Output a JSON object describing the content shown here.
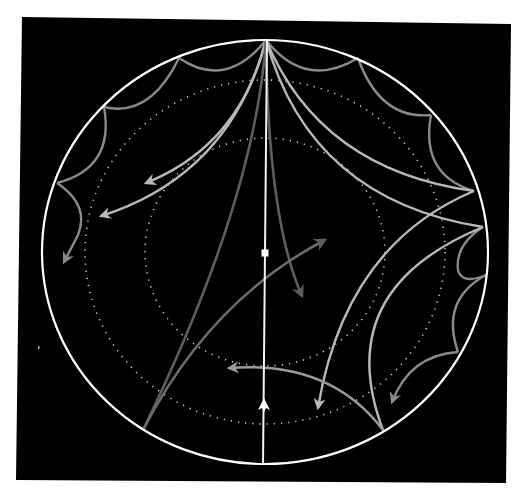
{
  "diagram": {
    "type": "poincare-disk-hyperbolic-tiling",
    "title": "",
    "colors": {
      "background": "#000000",
      "page": "#ffffff",
      "boundary": "#ffffff",
      "axis": "#f2f2f2",
      "dotted_rings": "#cfcfcf",
      "tile_edges": "#8a8a8a",
      "geodesic_light": "#b8b8b8",
      "geodesic_mid": "#9a9a9a",
      "geodesic_dark": "#5e5e5e"
    },
    "disk": {
      "cx": 265,
      "cy": 252,
      "rx": 223,
      "ry": 212
    },
    "dotted_rings": [
      {
        "name": "outer-dotted-ring",
        "rx": 180,
        "ry": 172
      },
      {
        "name": "inner-dotted-ring",
        "rx": 120,
        "ry": 114
      }
    ],
    "axis": {
      "from": [
        267,
        40
      ],
      "to": [
        263,
        464
      ],
      "center_marker": [
        265,
        253
      ],
      "arrow_marker": [
        265,
        405
      ]
    },
    "boundary_vertices": [
      [
        266,
        40
      ],
      [
        179,
        58
      ],
      [
        104,
        107
      ],
      [
        57,
        183
      ],
      [
        358,
        58
      ],
      [
        431,
        115
      ],
      [
        474,
        191
      ],
      [
        483,
        227
      ],
      [
        458,
        352
      ],
      [
        383,
        430
      ]
    ],
    "arrows": [
      {
        "name": "arrow-to-upper-left-inner",
        "tip": [
          146,
          183
        ]
      },
      {
        "name": "arrow-to-upper-left-outer",
        "tip": [
          101,
          216
        ]
      },
      {
        "name": "arrow-to-left-edge",
        "tip": [
          64,
          262
        ]
      },
      {
        "name": "arrow-to-center-right",
        "tip": [
          302,
          296
        ]
      },
      {
        "name": "arrow-to-upper-right-center",
        "tip": [
          325,
          240
        ]
      },
      {
        "name": "arrow-to-lower-center",
        "tip": [
          229,
          368
        ]
      },
      {
        "name": "arrow-to-lower-right-inner",
        "tip": [
          318,
          408
        ]
      },
      {
        "name": "arrow-to-lower-right-outer",
        "tip": [
          392,
          402
        ]
      }
    ]
  }
}
